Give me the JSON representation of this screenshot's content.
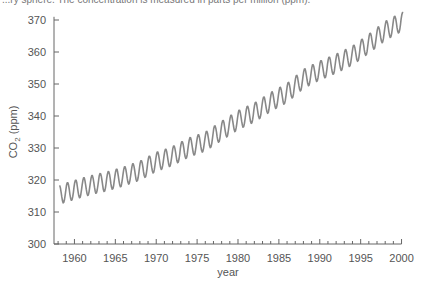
{
  "caption": "...ry sphere. The concentration is measured in parts per million (ppm).",
  "chart_data": {
    "type": "line",
    "title": "",
    "xlabel": "year",
    "ylabel": "CO2 (ppm)",
    "xlim": [
      1957.5,
      2000.3
    ],
    "ylim": [
      300,
      372
    ],
    "x_ticks": [
      1960,
      1965,
      1970,
      1975,
      1980,
      1985,
      1990,
      1995,
      2000
    ],
    "y_ticks": [
      300,
      310,
      320,
      330,
      340,
      350,
      360,
      370
    ],
    "grid": false,
    "legend": null,
    "line_color": "#888888",
    "series": [
      {
        "name": "Atmospheric CO2 (monthly, seasonal cycle)",
        "annual_mean": {
          "x": [
            1958,
            1960,
            1962,
            1964,
            1966,
            1968,
            1970,
            1972,
            1974,
            1976,
            1978,
            1980,
            1982,
            1984,
            1986,
            1988,
            1990,
            1992,
            1994,
            1996,
            1998,
            2000
          ],
          "y": [
            315.3,
            316.9,
            318.4,
            319.6,
            321.1,
            322.9,
            325.7,
            327.5,
            330.2,
            332.0,
            335.4,
            338.7,
            341.1,
            344.4,
            347.2,
            351.6,
            354.2,
            356.4,
            358.9,
            362.6,
            366.6,
            369.4
          ]
        },
        "seasonal_amplitude_ppm": 3
      }
    ]
  },
  "axes": {
    "x_title": "year",
    "y_title_main": "CO",
    "y_title_sub": "2",
    "y_title_units": " (ppm)"
  }
}
